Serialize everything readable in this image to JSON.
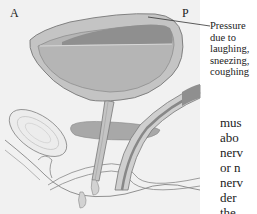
{
  "figure": {
    "orientation_labels": {
      "anterior": "A",
      "posterior": "P"
    },
    "callout": {
      "lines": [
        "Pressure",
        "due to",
        "laughing,",
        "sneezing,",
        "coughing"
      ]
    },
    "colors": {
      "background": "#f1f1f1",
      "bladder_wall": "#c4c4c4",
      "bladder_lumen": "#b3b3b3",
      "urine_dark": "#8f8f8f",
      "outline": "#777777"
    }
  },
  "body_text": {
    "lines": [
      "mus",
      "abo",
      "nerv",
      "or n",
      "nerv",
      "der",
      "the"
    ]
  }
}
